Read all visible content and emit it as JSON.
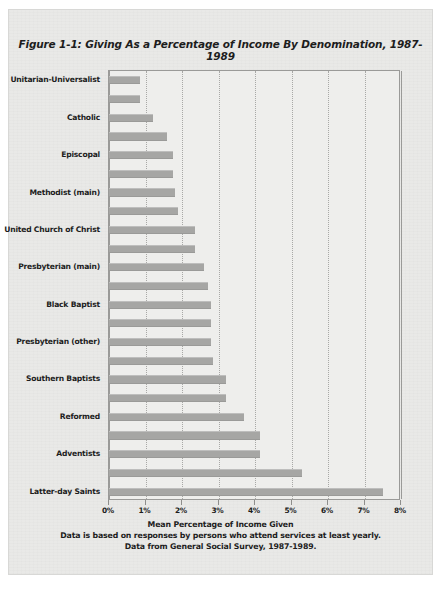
{
  "page": {
    "background_color": "#e9e9e7",
    "bar_color": "#a6a6a4",
    "text_color": "#1d1d1d",
    "grid_color": "#a8a8a6"
  },
  "chart_data": {
    "type": "bar",
    "orientation": "horizontal",
    "title": "Figure 1-1: Giving As a Percentage of Income By Denomination, 1987-1989",
    "xlabel": "Mean Percentage of Income Given",
    "ylabel": "",
    "xlim": [
      0,
      8
    ],
    "xtick_labels": [
      "0%",
      "1%",
      "2%",
      "3%",
      "4%",
      "5%",
      "6%",
      "7%",
      "8%"
    ],
    "xtick_values": [
      0,
      1,
      2,
      3,
      4,
      5,
      6,
      7,
      8
    ],
    "grid": true,
    "grid_axis": "x",
    "legend": false,
    "categories": [
      "Unitarian-Universalist",
      "",
      "Catholic",
      "",
      "Episcopal",
      "",
      "Methodist (main)",
      "",
      "United Church of Christ",
      "",
      "Presbyterian (main)",
      "",
      "Black Baptist",
      "",
      "Presbyterian (other)",
      "",
      "Southern Baptists",
      "",
      "Reformed",
      "",
      "Adventists",
      "",
      "Latter-day Saints"
    ],
    "values": [
      0.85,
      0.85,
      1.2,
      1.6,
      1.75,
      1.75,
      1.8,
      1.9,
      2.35,
      2.35,
      2.6,
      2.7,
      2.8,
      2.8,
      2.8,
      2.85,
      3.2,
      3.2,
      3.7,
      4.15,
      4.15,
      5.3,
      7.5
    ],
    "labeled_points": [
      {
        "label": "Unitarian-Universalist",
        "value": 0.85
      },
      {
        "label": "Catholic",
        "value": 1.2
      },
      {
        "label": "Episcopal",
        "value": 1.75
      },
      {
        "label": "Methodist (main)",
        "value": 1.8
      },
      {
        "label": "United Church of Christ",
        "value": 2.35
      },
      {
        "label": "Presbyterian (main)",
        "value": 2.6
      },
      {
        "label": "Black Baptist",
        "value": 2.8
      },
      {
        "label": "Presbyterian (other)",
        "value": 2.8
      },
      {
        "label": "Southern Baptists",
        "value": 3.2
      },
      {
        "label": "Reformed",
        "value": 3.7
      },
      {
        "label": "Adventists",
        "value": 4.15
      },
      {
        "label": "Latter-day Saints",
        "value": 7.5
      }
    ],
    "annotations": [
      "Mean Percentage of Income Given",
      "Data is based on responses by persons who attend services at least yearly.",
      "Data from General Social Survey, 1987-1989."
    ]
  },
  "captions": {
    "line1": "Mean Percentage of Income Given",
    "line2": "Data is based on responses by persons who attend services at least yearly.",
    "line3": "Data from General Social Survey, 1987-1989."
  },
  "bleed_text": {
    "line1": "Worship",
    "line2": "and Giving"
  }
}
